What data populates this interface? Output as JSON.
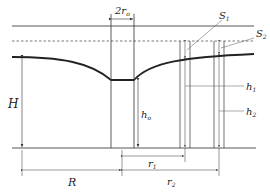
{
  "diagram": {
    "labels": {
      "well_diameter": "2r",
      "well_diameter_sub": "o",
      "S1": "S",
      "S1_sub": "1",
      "S2": "S",
      "S2_sub": "2",
      "h1": "h",
      "h1_sub": "1",
      "h2": "h",
      "h2_sub": "2",
      "H": "H",
      "h0": "h",
      "h0_sub": "o",
      "r1": "r",
      "r1_sub": "1",
      "r2": "r",
      "r2_sub": "2",
      "R": "R"
    },
    "colors": {
      "line": "#333333",
      "water_table": "#222222",
      "dashed": "#555555"
    }
  }
}
